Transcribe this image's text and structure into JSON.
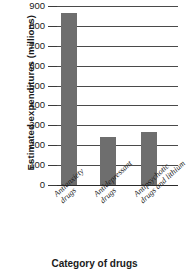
{
  "chart_data": {
    "type": "bar",
    "title": "",
    "xlabel": "Category of drugs",
    "ylabel": "Estimated expenditures (millions)",
    "categories": [
      "Antianxiety drugs",
      "Antidepressant drugs",
      "Antipsychotic drugs and lithium"
    ],
    "category_lines": [
      [
        "Antianxiety",
        "drugs"
      ],
      [
        "Antidepressant",
        "drugs"
      ],
      [
        "Antipsychotic",
        "drugs and lithium"
      ]
    ],
    "values": [
      865,
      240,
      265
    ],
    "ylim": [
      0,
      900
    ],
    "yticks": [
      900,
      800,
      700,
      600,
      500,
      400,
      300,
      200,
      100,
      0
    ],
    "ytick_labels": [
      "900",
      "800",
      "700",
      "600",
      "500",
      "400",
      "300",
      "200",
      "100",
      "0"
    ],
    "grid": "horizontal",
    "legend": "none",
    "bar_color": "#6e6e6e",
    "axis_color": "#4a4a4a",
    "text_color": "#1a1a1a"
  }
}
